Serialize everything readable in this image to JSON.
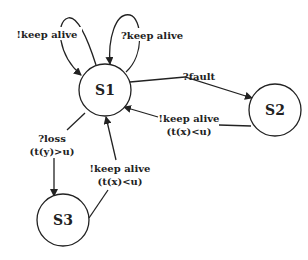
{
  "diagram": {
    "type": "state-machine",
    "states": [
      {
        "id": "S1",
        "label": "S1"
      },
      {
        "id": "S2",
        "label": "S2"
      },
      {
        "id": "S3",
        "label": "S3"
      }
    ],
    "transitions": [
      {
        "from": "S1",
        "to": "S1",
        "label_line1": "!keep alive",
        "label_line2": ""
      },
      {
        "from": "S1",
        "to": "S1",
        "label_line1": "?keep alive",
        "label_line2": ""
      },
      {
        "from": "S1",
        "to": "S2",
        "label_line1": "?fault",
        "label_line2": ""
      },
      {
        "from": "S2",
        "to": "S1",
        "label_line1": "!keep alive",
        "label_line2": "(t(x)<u)"
      },
      {
        "from": "S1",
        "to": "S3",
        "label_line1": "?loss",
        "label_line2": "(t(y)>u)"
      },
      {
        "from": "S3",
        "to": "S1",
        "label_line1": "!keep alive",
        "label_line2": "(t(x)<u)"
      }
    ]
  }
}
